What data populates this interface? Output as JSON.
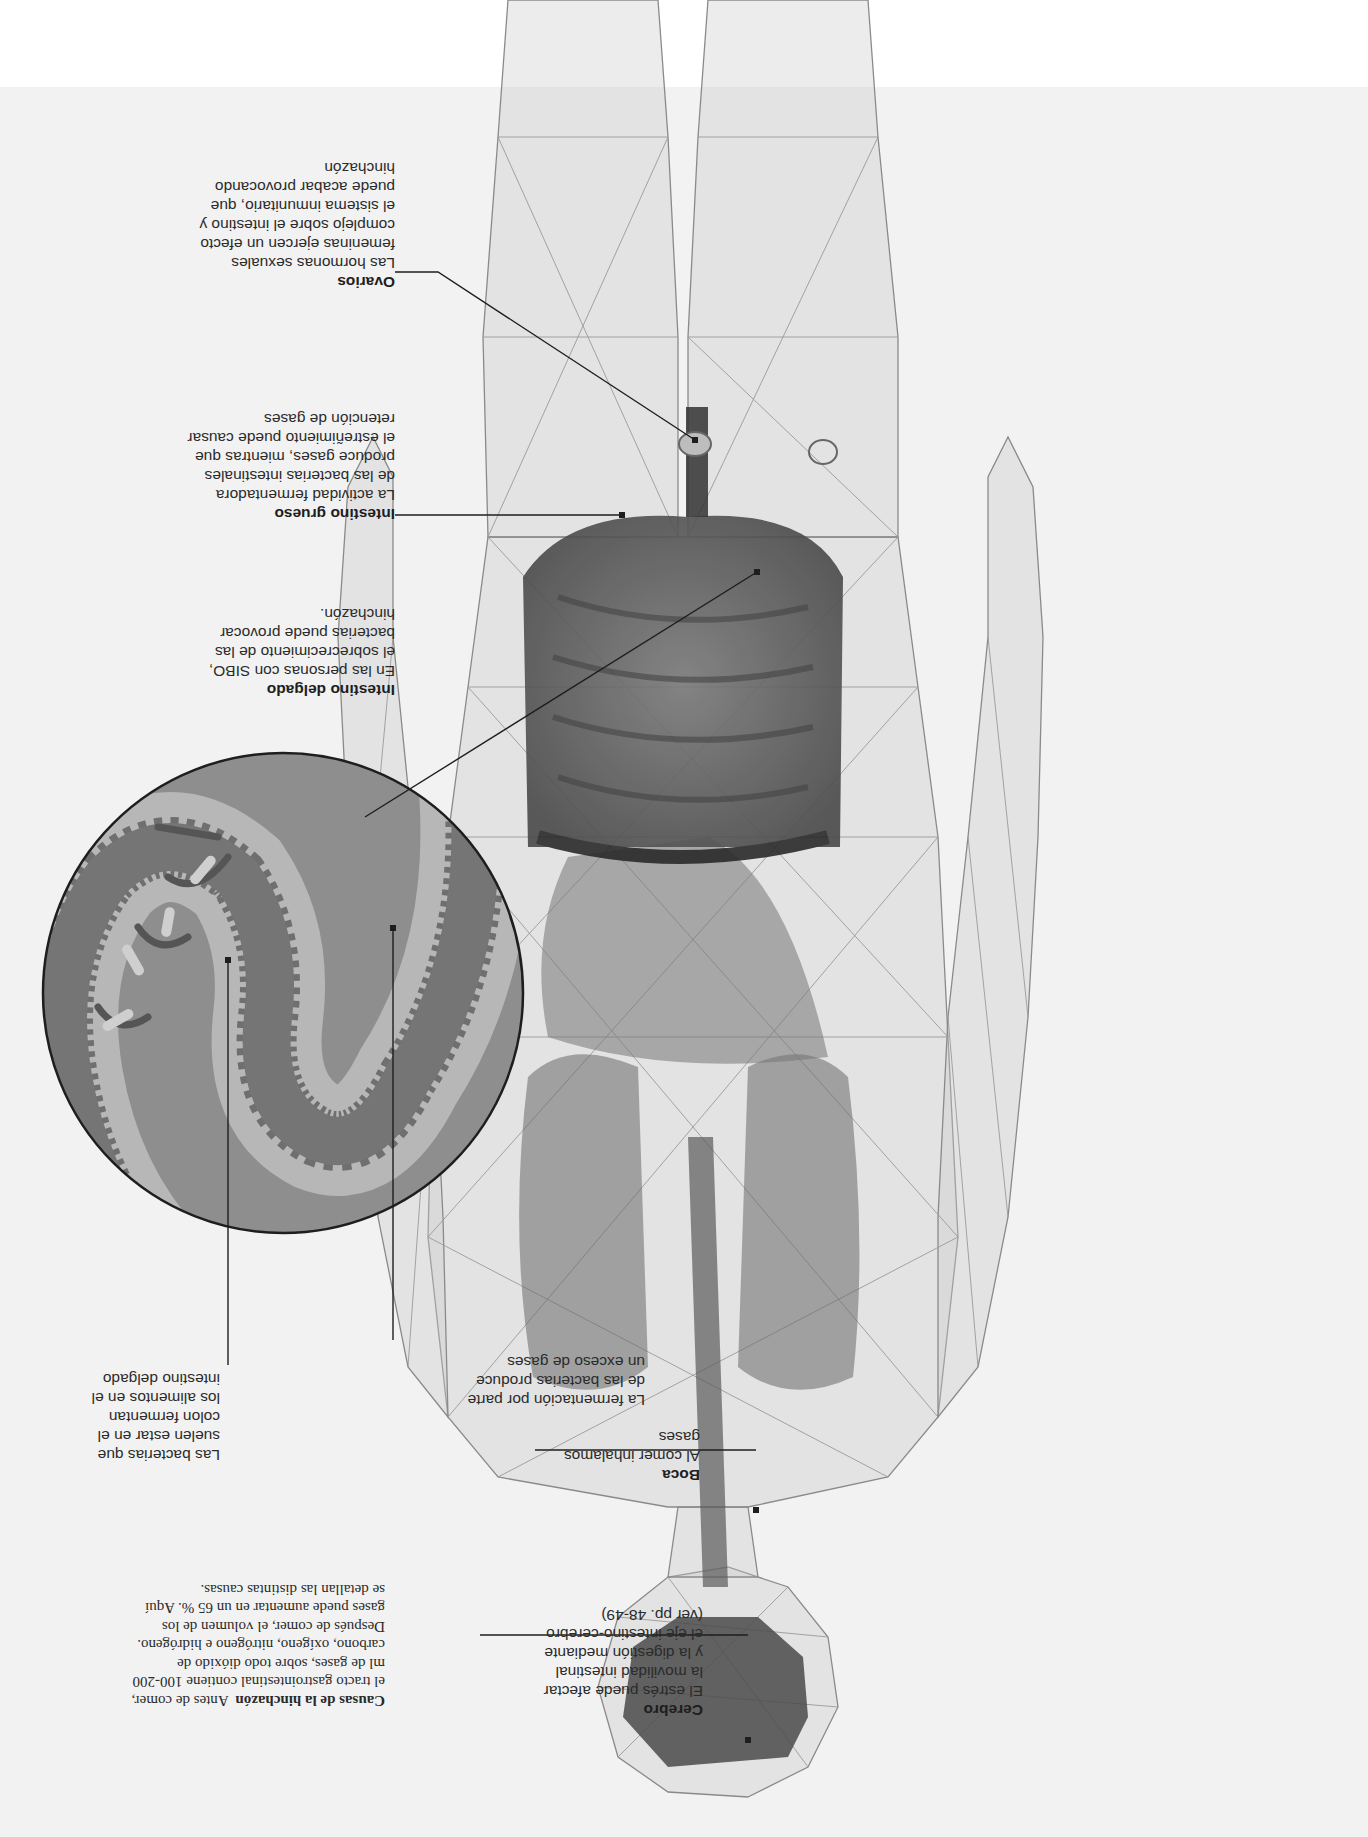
{
  "intro": {
    "title": "Causas de la hinchazón",
    "text": "Antes de comer, el tracto gastrointestinal contiene 100-200 ml de gases, sobre todo dióxido de carbono, oxígeno, nitrógeno e hidrógeno. Después de comer, el volumen de los gases puede aumentar en un 65 %. Aquí se detallan las distintas causas."
  },
  "labels": {
    "cerebro": {
      "title": "Cerebro",
      "text": "El estrés puede afectar\nla movilidad intestinal\ny la digestión mediante\nel eje intestino-cerebro\n(ver pp. 48-49)"
    },
    "boca": {
      "title": "Boca",
      "text": "Al comer inhalamos\ngases"
    },
    "fermentacion": {
      "text": "La fermentación por parte\nde las bacterias produce\nun exceso de gases"
    },
    "bacterias": {
      "text": "Las bacterias que\nsuelen estar en el\ncolon fermentan\nlos alimentos en el\nintestino delgado"
    },
    "intestino_delgado": {
      "title": "Intestino delgado",
      "text": "En las personas con SIBO,\nel sobrecrecimiento de las\nbacterias puede provocar\nhinchazón."
    },
    "intestino_grueso": {
      "title": "Intestino grueso",
      "text": "La actividad fermentadora\nde las bacterias intestinales\nproduce gases, mientras que\nel estreñimiento puede causar\nretención de gases"
    },
    "ovarios": {
      "title": "Ovarios",
      "text": "Las hormonas sexuales\nfemeninas ejercen un efecto\ncomplejo sobre el intestino y\nel sistema inmunitario, que\npuede acabar provocando\nhinchazón"
    }
  },
  "colors": {
    "background": "#f2f2f2",
    "band": "#ffffff",
    "mesh": "#8a8a8a",
    "organ_dark": "#3c3c3c",
    "circle_outer": "#8e8e8e",
    "circle_light": "#b7b7b7",
    "circle_wall": "#6f6f6f"
  },
  "orientation": "rotated 180°"
}
